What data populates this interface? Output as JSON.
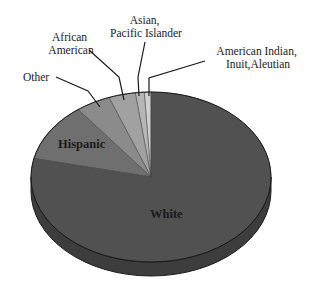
{
  "chart_data": {
    "type": "pie",
    "style": "3d-tilted",
    "title": "",
    "categories": [
      "White",
      "Hispanic",
      "Other",
      "African American",
      "Asian, Pacific Islander",
      "American Indian, Inuit, Aleutian"
    ],
    "values": [
      78.5,
      11.1,
      4.7,
      3.6,
      1.2,
      0.9
    ],
    "unit": "percent (estimated from slice angles)",
    "colors": [
      "#515151",
      "#6f6f6f",
      "#8b8b8b",
      "#a1a1a1",
      "#b6b6b6",
      "#d0d0d0"
    ],
    "labels": {
      "white": "White",
      "hispanic": "Hispanic",
      "other": "Other",
      "african_american": [
        "African",
        "American"
      ],
      "asian": [
        "Asian,",
        "Pacific Islander"
      ],
      "american_indian": [
        "American Indian,",
        "Inuit,Aleutian"
      ]
    },
    "legend": "none (leader-line labels)"
  }
}
